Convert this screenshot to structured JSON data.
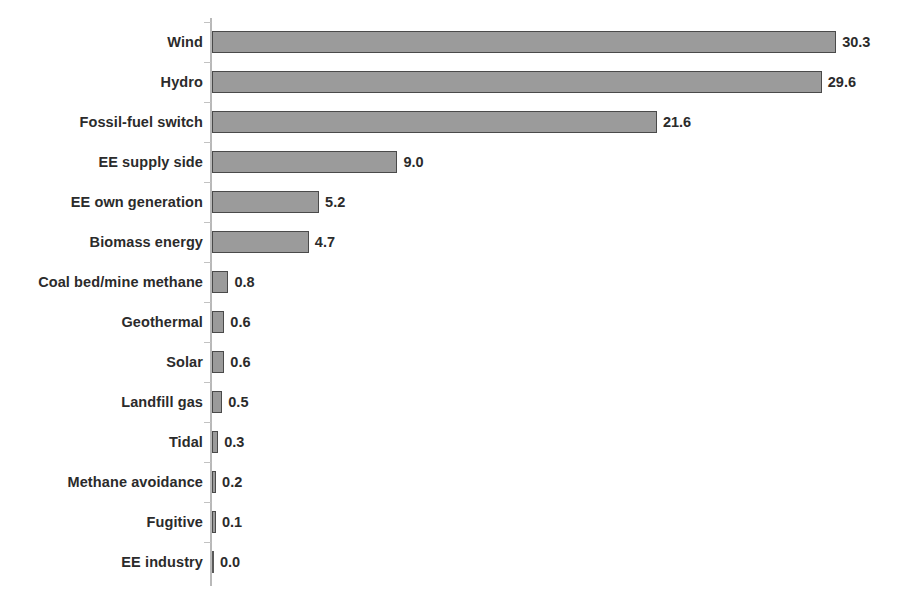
{
  "chart_data": {
    "type": "bar",
    "orientation": "horizontal",
    "title": "",
    "subtitle": "",
    "xlabel": "",
    "ylabel": "",
    "grid": false,
    "legend": "none",
    "axis_visible": {
      "x": false,
      "y": true
    },
    "xlim": [
      0,
      33.2
    ],
    "categories": [
      "Wind",
      "Hydro",
      "Fossil-fuel switch",
      "EE supply side",
      "EE own generation",
      "Biomass energy",
      "Coal bed/mine methane",
      "Geothermal",
      "Solar",
      "Landfill gas",
      "Tidal",
      "Methane avoidance",
      "Fugitive",
      "EE industry"
    ],
    "values": [
      30.3,
      29.6,
      21.6,
      9.0,
      5.2,
      4.7,
      0.8,
      0.6,
      0.6,
      0.5,
      0.3,
      0.2,
      0.1,
      0.0
    ],
    "data_labels": [
      "30.3",
      "29.6",
      "21.6",
      "9.0",
      "5.2",
      "4.7",
      "0.8",
      "0.6",
      "0.6",
      "0.5",
      "0.3",
      "0.2",
      "0.1",
      "0.0"
    ],
    "colors": {
      "bar_fill": "#9b9b9b",
      "bar_border": "#4a4a4a",
      "text": "#2b2b2b",
      "axis": "#b9b9b9",
      "background": "#ffffff"
    }
  }
}
